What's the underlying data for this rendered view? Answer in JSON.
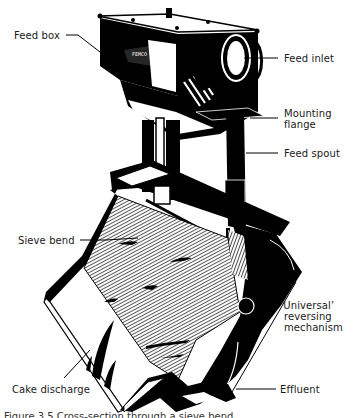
{
  "figure": {
    "labels": {
      "feed_box": "Feed box",
      "feed_inlet": "Feed inlet",
      "mounting_flange_1": "Mounting",
      "mounting_flange_2": "flange",
      "feed_spout": "Feed spout",
      "sieve_bend": "Sieve bend",
      "reversing_1": "‘Universal’",
      "reversing_2": "reversing",
      "reversing_3": "mechanism",
      "cake_discharge": "Cake discharge",
      "effluent": "Effluent"
    },
    "caption": "Figure 3.5  Cross-section through a sieve bend"
  },
  "colors": {
    "ink": "#000000",
    "paper": "#ffffff",
    "label_text": "#1a1a1a"
  }
}
